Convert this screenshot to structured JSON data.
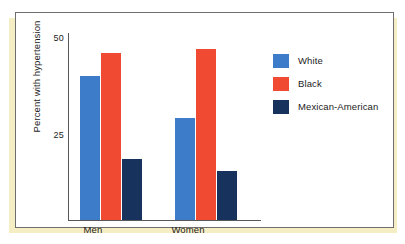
{
  "chart_data": {
    "type": "bar",
    "title": "",
    "xlabel": "",
    "ylabel": "Percent with hypertension",
    "categories": [
      "Men",
      "Women"
    ],
    "series": [
      {
        "name": "White",
        "color": "#3d7cc9",
        "values": [
          40,
          29.5
        ]
      },
      {
        "name": "Black",
        "color": "#f04a32",
        "values": [
          46,
          47
        ]
      },
      {
        "name": "Mexican-American",
        "color": "#17325c",
        "values": [
          19,
          16
        ]
      }
    ],
    "ytick_labels": [
      "50",
      "25"
    ],
    "ytick_values": [
      50,
      25
    ],
    "ylim": [
      3.5,
      51
    ],
    "grid": false,
    "legend_position": "right"
  },
  "axis": {
    "y_title": "Percent with hypertension",
    "tick_50": "50",
    "tick_25": "25"
  },
  "categories": {
    "men": "Men",
    "women": "Women"
  },
  "legend": {
    "items": [
      {
        "label": "White"
      },
      {
        "label": "Black"
      },
      {
        "label": "Mexican-American"
      }
    ]
  }
}
